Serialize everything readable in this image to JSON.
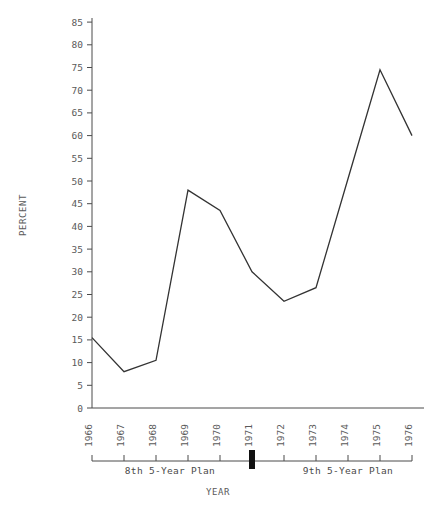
{
  "chart_data": {
    "type": "line",
    "title": "",
    "xlabel": "YEAR",
    "ylabel": "PERCENT",
    "categories": [
      "1966",
      "1967",
      "1968",
      "1969",
      "1970",
      "1971",
      "1972",
      "1973",
      "1974",
      "1975",
      "1976"
    ],
    "values": [
      15.5,
      8,
      10.5,
      48,
      43.5,
      30,
      23.5,
      26.5,
      50.5,
      74.5,
      60
    ],
    "series": [
      {
        "name": "percent",
        "values": [
          15.5,
          8,
          10.5,
          48,
          43.5,
          30,
          23.5,
          26.5,
          50.5,
          74.5,
          60
        ]
      }
    ],
    "ylim": [
      0,
      85
    ],
    "ytick_step": 5,
    "yticks": [
      "0",
      "5",
      "10",
      "15",
      "20",
      "25",
      "30",
      "35",
      "40",
      "45",
      "50",
      "55",
      "60",
      "65",
      "70",
      "75",
      "80",
      "85"
    ],
    "xticks": [
      "1966",
      "1967",
      "1968",
      "1969",
      "1970",
      "1971",
      "1972",
      "1973",
      "1974",
      "1975",
      "1976"
    ],
    "grid": false,
    "legend": "none",
    "line_color": "#333333",
    "text_color": "#5a5a5a",
    "background": "#ffffff",
    "annotations": [
      {
        "label": "8th 5-Year Plan",
        "start": "1966",
        "end": "1971"
      },
      {
        "label": "9th 5-Year Plan",
        "start": "1971",
        "end": "1976"
      }
    ],
    "plan_divider_year": "1971"
  },
  "axes": {
    "y_title": "PERCENT",
    "x_title": "YEAR"
  },
  "plan_axis": {
    "left_label": "8th 5-Year Plan",
    "right_label": "9th 5-Year Plan"
  }
}
